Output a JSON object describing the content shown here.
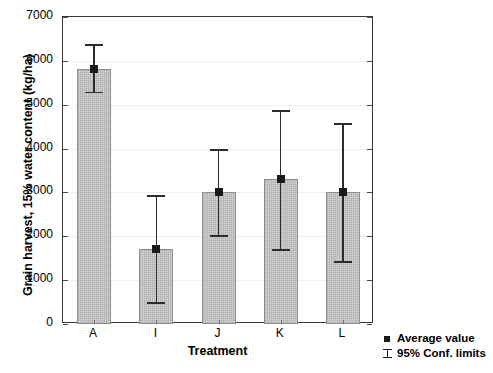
{
  "chart_data": {
    "type": "bar",
    "title": "",
    "xlabel": "Treatment",
    "ylabel": "Grain harvest, 15% water content (kg/ha)",
    "categories": [
      "A",
      "I",
      "J",
      "K",
      "L"
    ],
    "values": [
      5820,
      1720,
      3000,
      3300,
      3010
    ],
    "series": [
      {
        "name": "Average value",
        "values": [
          5820,
          1720,
          3000,
          3300,
          3010
        ]
      }
    ],
    "error_bars": {
      "name": "95% Conf. limits",
      "lower": [
        5300,
        500,
        2020,
        1700,
        1440
      ],
      "upper": [
        6380,
        2930,
        3980,
        4880,
        4580
      ]
    },
    "ylim": [
      0,
      7000
    ],
    "ytick_labels": [
      "0",
      "1000",
      "2000",
      "3000",
      "4000",
      "5000",
      "6000",
      "7000"
    ],
    "ytick_values": [
      0,
      1000,
      2000,
      3000,
      4000,
      5000,
      6000,
      7000
    ],
    "grid": true,
    "legend_position": "bottom-right",
    "legend": [
      {
        "label": "Average value",
        "symbol": "filled-square-marker"
      },
      {
        "label": "95% Conf. limits",
        "symbol": "error-bar-bracket"
      }
    ],
    "colors": {
      "bar_fill": "#d2d2d2",
      "bar_edge": "#8d8d8d",
      "marker": "#1a1a1a",
      "error_bar": "#2b2b2b",
      "axis": "#3a3a3a",
      "grid": "#f0efef",
      "text": "#000000",
      "background": "#ffffff"
    }
  }
}
